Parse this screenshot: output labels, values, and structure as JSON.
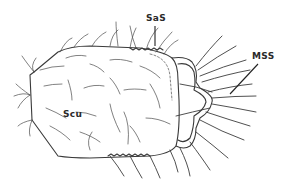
{
  "figure": {
    "labels": [
      {
        "id": "sas",
        "text": "SaS"
      },
      {
        "id": "mss",
        "text": "MSS"
      },
      {
        "id": "scu",
        "text": "Scu"
      }
    ],
    "colors": {
      "background": "#ffffff",
      "line": "#3a3a3a"
    }
  }
}
